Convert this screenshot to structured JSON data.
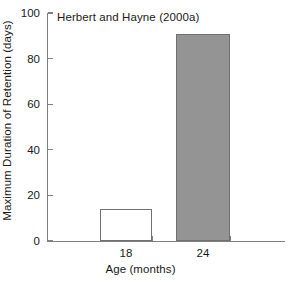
{
  "chart_data": {
    "type": "bar",
    "title": "",
    "annotation": "Herbert and Hayne (2000a)",
    "categories": [
      "18",
      "24"
    ],
    "values": [
      14,
      91
    ],
    "xlabel": "Age (months)",
    "ylabel": "Maximum Duration of Retention (days)",
    "ylim": [
      0,
      100
    ],
    "yticks": [
      "0",
      "20",
      "40",
      "60",
      "80",
      "100"
    ],
    "ytick_values": [
      0,
      20,
      40,
      60,
      80,
      100
    ],
    "grid": false,
    "legend": false,
    "bars": [
      {
        "category": "18",
        "value": 14,
        "fill": "#ffffff",
        "edge": "#707070"
      },
      {
        "category": "24",
        "value": 91,
        "fill": "#949494",
        "edge": "#707070"
      }
    ],
    "axis_color": "#808080",
    "text_color": "#1a1a1a"
  }
}
